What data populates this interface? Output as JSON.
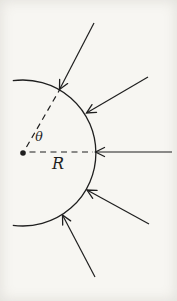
{
  "figure": {
    "kind": "physics-diagram",
    "colors": {
      "ink": "#1f1f1f",
      "paper": "#f7f6f2"
    },
    "center": {
      "x": 23,
      "y": 153
    },
    "dot_radius": 2.8,
    "arc": {
      "radius": 73,
      "start_angle_deg": 98,
      "end_angle_deg": -98,
      "stroke_width": 1.3
    },
    "dashed_lines": [
      {
        "x1": 29.5,
        "y1": 152,
        "x2": 93,
        "y2": 152
      },
      {
        "x1": 26.5,
        "y1": 147,
        "x2": 59.5,
        "y2": 90
      }
    ],
    "arrows": [
      {
        "x1": 94,
        "y1": 23,
        "x2": 59.5,
        "y2": 89.5
      },
      {
        "x1": 148,
        "y1": 77,
        "x2": 86.5,
        "y2": 113
      },
      {
        "x1": 172,
        "y1": 152,
        "x2": 95.5,
        "y2": 152
      },
      {
        "x1": 149,
        "y1": 224,
        "x2": 87,
        "y2": 190
      },
      {
        "x1": 95,
        "y1": 277,
        "x2": 62.5,
        "y2": 215
      }
    ],
    "labels": {
      "angle": {
        "text": "θ",
        "x": 39,
        "y": 141,
        "font_size": 12.5
      },
      "radius": {
        "text": "R",
        "x": 58,
        "y": 169,
        "font_size": 16
      }
    }
  }
}
